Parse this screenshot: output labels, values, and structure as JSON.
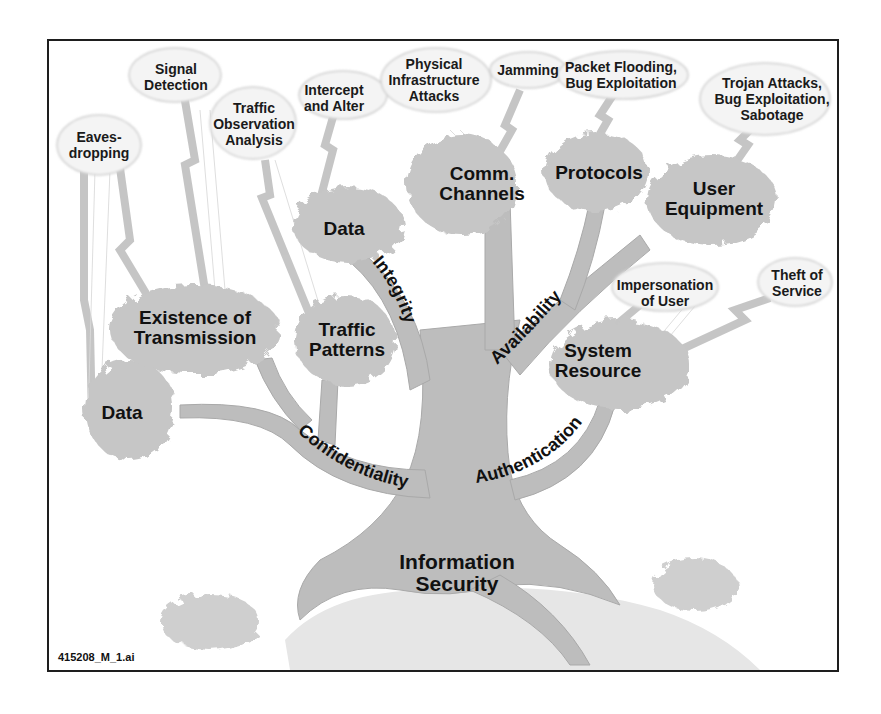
{
  "diagram": {
    "root": "Information Security",
    "branches": [
      {
        "label": "Confidentiality",
        "leaves": [
          "Data",
          "Existence of Transmission",
          "Traffic Patterns"
        ]
      },
      {
        "label": "Integrity",
        "leaves": [
          "Data"
        ]
      },
      {
        "label": "Availability",
        "leaves": [
          "Comm. Channels",
          "Protocols",
          "User Equipment"
        ]
      },
      {
        "label": "Authentication",
        "leaves": [
          "System Resource"
        ]
      }
    ],
    "threats": [
      {
        "label": "Eaves-dropping",
        "target": "Data (Confidentiality)"
      },
      {
        "label": "Signal Detection",
        "target": "Existence of Transmission"
      },
      {
        "label": "Traffic Observation Analysis",
        "target": "Traffic Patterns"
      },
      {
        "label": "Intercept and Alter",
        "target": "Data (Integrity)"
      },
      {
        "label": "Physical Infrastructure Attacks",
        "target": "Comm. Channels"
      },
      {
        "label": "Jamming",
        "target": "Comm. Channels"
      },
      {
        "label": "Packet Flooding, Bug Exploitation",
        "target": "Protocols"
      },
      {
        "label": "Trojan Attacks, Bug Exploitation, Sabotage",
        "target": "User Equipment"
      },
      {
        "label": "Impersonation of User",
        "target": "System Resource"
      },
      {
        "label": "Theft of Service",
        "target": "System Resource"
      }
    ]
  },
  "labels": {
    "root_line1": "Information",
    "root_line2": "Security",
    "branch_confidentiality": "Confidentiality",
    "branch_integrity": "Integrity",
    "branch_availability": "Availability",
    "branch_authentication": "Authentication",
    "leaf_data_conf": "Data",
    "leaf_existence_1": "Existence of",
    "leaf_existence_2": "Transmission",
    "leaf_traffic_1": "Traffic",
    "leaf_traffic_2": "Patterns",
    "leaf_data_int": "Data",
    "leaf_comm_1": "Comm.",
    "leaf_comm_2": "Channels",
    "leaf_protocols": "Protocols",
    "leaf_user_1": "User",
    "leaf_user_2": "Equipment",
    "leaf_system_1": "System",
    "leaf_system_2": "Resource",
    "threat_eaves_1": "Eaves-",
    "threat_eaves_2": "dropping",
    "threat_signal_1": "Signal",
    "threat_signal_2": "Detection",
    "threat_traffic_1": "Traffic",
    "threat_traffic_2": "Observation",
    "threat_traffic_3": "Analysis",
    "threat_intercept_1": "Intercept",
    "threat_intercept_2": "and Alter",
    "threat_physical_1": "Physical",
    "threat_physical_2": "Infrastructure",
    "threat_physical_3": "Attacks",
    "threat_jamming": "Jamming",
    "threat_packet_1": "Packet Flooding,",
    "threat_packet_2": "Bug Exploitation",
    "threat_trojan_1": "Trojan Attacks,",
    "threat_trojan_2": "Bug Exploitation,",
    "threat_trojan_3": "Sabotage",
    "threat_impersonation_1": "Impersonation",
    "threat_impersonation_2": "of User",
    "threat_theft_1": "Theft of",
    "threat_theft_2": "Service",
    "file_name": "415208_M_1.ai"
  },
  "colors": {
    "trunk": "#bdbdbd",
    "canopy": "#c4c4c4",
    "cloud": "#f3f3f3",
    "bolt": "#b0b0b0",
    "frame": "#1e1e1e",
    "text": "#111111"
  }
}
